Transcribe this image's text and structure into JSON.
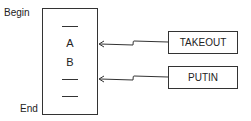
{
  "diagram": {
    "labels": {
      "begin": "Begin",
      "end": "End"
    },
    "stack": {
      "items": [
        {
          "type": "empty",
          "text": ""
        },
        {
          "type": "value",
          "text": "A"
        },
        {
          "type": "value",
          "text": "B"
        },
        {
          "type": "empty",
          "text": ""
        },
        {
          "type": "empty",
          "text": ""
        }
      ]
    },
    "operations": [
      {
        "label": "TAKEOUT",
        "points_to": "A"
      },
      {
        "label": "PUTIN",
        "points_to": "empty slot after B"
      }
    ],
    "colors": {
      "stroke": "#333333",
      "background": "#ffffff"
    }
  }
}
